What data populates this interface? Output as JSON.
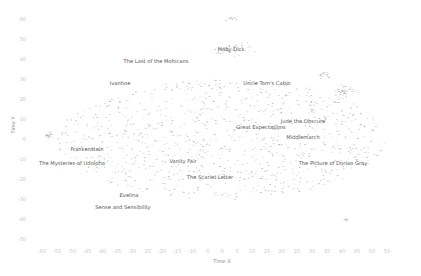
{
  "chart_data": {
    "type": "scatter",
    "title": "",
    "xlabel": "Time X",
    "ylabel": "Time Y",
    "xlim": [
      -65,
      60
    ],
    "ylim": [
      -55,
      65
    ],
    "grid": false,
    "legend": "none",
    "x_ticks": [
      -60,
      -55,
      -50,
      -45,
      -40,
      -35,
      -30,
      -25,
      -20,
      -15,
      -10,
      -5,
      0,
      5,
      10,
      15,
      20,
      25,
      30,
      35,
      40,
      45,
      50,
      55
    ],
    "y_ticks": [
      60,
      50,
      40,
      30,
      20,
      10,
      0,
      -10,
      -20,
      -30,
      -40,
      -50
    ],
    "point_color": "#8c8c8c",
    "annotations": [
      {
        "text": "Moby Dick",
        "x": 3,
        "y": 44
      },
      {
        "text": "The Last of the Mohicans",
        "x": -22,
        "y": 38
      },
      {
        "text": "Ivanhoe",
        "x": -34,
        "y": 27
      },
      {
        "text": "Uncle Tom's Cabin",
        "x": 15,
        "y": 27
      },
      {
        "text": "Jude the Obscure",
        "x": 27,
        "y": 8
      },
      {
        "text": "Great Expectations",
        "x": 13,
        "y": 5
      },
      {
        "text": "Middlemarch",
        "x": 27,
        "y": 0
      },
      {
        "text": "Frankenstein",
        "x": -45,
        "y": -6
      },
      {
        "text": "The Mysteries of Udolpho",
        "x": -50,
        "y": -13
      },
      {
        "text": "Vanity Fair",
        "x": -13,
        "y": -12
      },
      {
        "text": "The Scarlet Letter",
        "x": -4,
        "y": -20
      },
      {
        "text": "The Picture of Dorian Gray",
        "x": 37,
        "y": -13
      },
      {
        "text": "Evelina",
        "x": -31,
        "y": -29
      },
      {
        "text": "Sense and Sensibility",
        "x": -33,
        "y": -35
      }
    ],
    "clusters": [
      {
        "name": "main-cloud",
        "cx": 0,
        "cy": 0,
        "rx": 55,
        "ry": 30,
        "n": 900
      },
      {
        "name": "top-center",
        "cx": 3,
        "cy": 60,
        "rx": 3,
        "ry": 2,
        "n": 10
      },
      {
        "name": "moby-dick-group",
        "cx": 4,
        "cy": 45,
        "rx": 8,
        "ry": 5,
        "n": 40
      },
      {
        "name": "left-blob",
        "cx": -58,
        "cy": 2,
        "rx": 1.5,
        "ry": 2,
        "n": 20
      },
      {
        "name": "right-cluster",
        "cx": 41,
        "cy": 24,
        "rx": 5,
        "ry": 4,
        "n": 40
      },
      {
        "name": "upper-right",
        "cx": 34,
        "cy": 32,
        "rx": 3,
        "ry": 3,
        "n": 15
      },
      {
        "name": "bottom-right",
        "cx": 41,
        "cy": -40,
        "rx": 1.5,
        "ry": 1,
        "n": 8
      }
    ]
  }
}
